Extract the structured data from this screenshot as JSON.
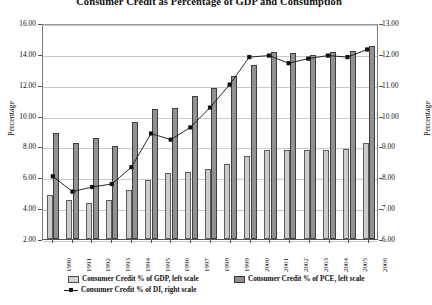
{
  "chart_data": {
    "type": "bar",
    "title": "Consumer Credit as Percentage of GDP and Consumption",
    "xlabel": "",
    "ylabel": "Percentage",
    "ylabel_right": "Percentage",
    "grid": true,
    "legend_position": "bottom",
    "categories": [
      "1990",
      "1991",
      "1992",
      "1993",
      "1994",
      "1995",
      "1996",
      "1997",
      "1998",
      "1999",
      "2000",
      "2001",
      "2002",
      "2003",
      "2004",
      "2005",
      "2006"
    ],
    "ylim": [
      2.0,
      16.0
    ],
    "ylim_right": [
      6.0,
      13.0
    ],
    "ytick_labels_left": [
      "16.00",
      "14.00",
      "12.00",
      "10.00",
      "8.00",
      "6.00",
      "4.00",
      "2.00"
    ],
    "ytick_labels_right": [
      "13.00",
      "12.00",
      "11.00",
      "10.00",
      "9.00",
      "8.00",
      "7.00",
      "6.00"
    ],
    "series": [
      {
        "name": "Consumer Credit % of GDP, left scale",
        "axis": "left",
        "kind": "bar",
        "color": "#cccccc",
        "values": [
          4.85,
          4.55,
          4.35,
          4.55,
          5.15,
          5.85,
          6.3,
          6.35,
          6.55,
          6.85,
          7.35,
          7.75,
          7.8,
          7.75,
          7.8,
          7.85,
          8.2
        ]
      },
      {
        "name": "Consumer Credit % of PCE, left scale",
        "axis": "left",
        "kind": "bar",
        "color": "#919191",
        "values": [
          8.9,
          8.25,
          8.55,
          8.0,
          9.6,
          10.4,
          10.5,
          11.25,
          11.8,
          12.55,
          13.3,
          14.15,
          14.05,
          13.9,
          14.1,
          14.2,
          14.5
        ]
      },
      {
        "name": "Consumer Credit % of DI, right scale",
        "axis": "right",
        "kind": "line",
        "color": "#111111",
        "marker": "square",
        "values": [
          8.05,
          7.55,
          7.7,
          7.8,
          8.35,
          9.45,
          9.25,
          9.65,
          10.3,
          11.05,
          11.95,
          12.0,
          11.75,
          11.9,
          12.0,
          11.95,
          12.2
        ]
      }
    ]
  },
  "legend": {
    "gdp": "Consumer Credit % of GDP, left scale",
    "pce": "Consumer Credit % of PCE, left scale",
    "di": "Consumer Credit % of DI, right scale"
  }
}
